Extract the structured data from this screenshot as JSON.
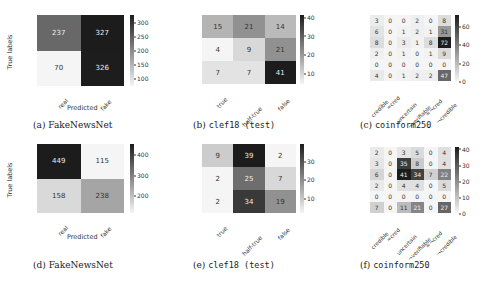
{
  "chart_data": [
    {
      "id": "a",
      "type": "heatmap",
      "caption_prefix": "(a)",
      "caption_name": "FakeNewsNet",
      "caption_mono": false,
      "ylabel": "True labels",
      "xlabel": "Predicted",
      "rows": [
        "real",
        "fake"
      ],
      "cols": [
        "real",
        "fake"
      ],
      "values": [
        [
          237,
          327
        ],
        [
          70,
          326
        ]
      ],
      "vmin": 70,
      "vmax": 327,
      "colorbar_ticks": [
        300,
        250,
        200,
        150,
        100
      ]
    },
    {
      "id": "b",
      "type": "heatmap",
      "caption_prefix": "(b)",
      "caption_name": "clef18 (test)",
      "caption_mono": true,
      "ylabel": "",
      "xlabel": "",
      "rows": [
        "true",
        "half-true",
        "false"
      ],
      "cols": [
        "true",
        "half-true",
        "false"
      ],
      "values": [
        [
          15,
          21,
          14
        ],
        [
          4,
          9,
          21
        ],
        [
          7,
          7,
          41
        ]
      ],
      "vmin": 4,
      "vmax": 41,
      "colorbar_ticks": [
        40,
        30,
        20,
        10
      ]
    },
    {
      "id": "c",
      "type": "heatmap",
      "caption_prefix": "(c)",
      "caption_name": "coinform250",
      "caption_mono": true,
      "ylabel": "",
      "xlabel": "",
      "rows": [
        "credible",
        "≈cred",
        "uncertain",
        "¬verifiable",
        "≈¬cred",
        "¬credible"
      ],
      "cols": [
        "credible",
        "≈cred",
        "uncertain",
        "¬verifiable",
        "≈¬cred",
        "¬credible"
      ],
      "values": [
        [
          3,
          0,
          0,
          2,
          0,
          8
        ],
        [
          6,
          0,
          1,
          2,
          1,
          31
        ],
        [
          8,
          0,
          3,
          1,
          8,
          72
        ],
        [
          2,
          0,
          1,
          0,
          1,
          9
        ],
        [
          0,
          0,
          0,
          0,
          0,
          0
        ],
        [
          4,
          0,
          1,
          2,
          2,
          47
        ]
      ],
      "vmin": 0,
      "vmax": 72,
      "colorbar_ticks": [
        60,
        40,
        20,
        0
      ]
    },
    {
      "id": "d",
      "type": "heatmap",
      "caption_prefix": "(d)",
      "caption_name": "FakeNewsNet",
      "caption_mono": false,
      "ylabel": "True labels",
      "xlabel": "Predicted",
      "rows": [
        "real",
        "fake"
      ],
      "cols": [
        "real",
        "fake"
      ],
      "values": [
        [
          449,
          115
        ],
        [
          158,
          238
        ]
      ],
      "vmin": 115,
      "vmax": 449,
      "colorbar_ticks": [
        400,
        300,
        200
      ]
    },
    {
      "id": "e",
      "type": "heatmap",
      "caption_prefix": "(e)",
      "caption_name": "clef18 (test)",
      "caption_mono": true,
      "ylabel": "",
      "xlabel": "",
      "rows": [
        "true",
        "half-true",
        "false"
      ],
      "cols": [
        "true",
        "half-true",
        "false"
      ],
      "values": [
        [
          9,
          39,
          2
        ],
        [
          2,
          25,
          7
        ],
        [
          2,
          34,
          19
        ]
      ],
      "vmin": 2,
      "vmax": 39,
      "colorbar_ticks": [
        30,
        20,
        10
      ]
    },
    {
      "id": "f",
      "type": "heatmap",
      "caption_prefix": "(f)",
      "caption_name": "coinform250",
      "caption_mono": true,
      "ylabel": "",
      "xlabel": "",
      "rows": [
        "credible",
        "≈cred",
        "uncertain",
        "¬verifiable",
        "≈¬cred",
        "¬credible"
      ],
      "cols": [
        "credible",
        "≈cred",
        "uncertain",
        "¬verifiable",
        "≈¬cred",
        "¬credible"
      ],
      "values": [
        [
          2,
          0,
          3,
          5,
          0,
          4
        ],
        [
          3,
          0,
          35,
          8,
          0,
          4
        ],
        [
          6,
          0,
          41,
          34,
          7,
          22
        ],
        [
          2,
          0,
          4,
          4,
          0,
          5
        ],
        [
          0,
          0,
          0,
          0,
          0,
          0
        ],
        [
          7,
          0,
          11,
          21,
          0,
          27
        ]
      ],
      "vmin": 0,
      "vmax": 41,
      "colorbar_ticks": [
        40,
        30,
        20,
        10,
        0
      ]
    }
  ],
  "layout": [
    {
      "left": 37,
      "top": 15,
      "w": 87,
      "h": 71,
      "cbx": 130,
      "cby": 15,
      "cbh": 71,
      "cap_x": 33,
      "cap_y": 120,
      "xlab_y": 88,
      "xtitle_x": 67,
      "xtitle_y": 104,
      "ytitle_x": 10,
      "ytitle_y": 52,
      "fs": 7,
      "xlab_fs": 6
    },
    {
      "left": 202,
      "top": 15,
      "w": 94,
      "h": 69,
      "cbx": 300,
      "cby": 15,
      "cbh": 69,
      "cap_x": 193,
      "cap_y": 120,
      "xlab_y": 86,
      "fs": 7,
      "xlab_fs": 6
    },
    {
      "left": 370,
      "top": 15,
      "w": 81,
      "h": 66,
      "cbx": 455,
      "cby": 15,
      "cbh": 66,
      "cap_x": 360,
      "cap_y": 120,
      "xlab_y": 82,
      "fs": 6,
      "xlab_fs": 5.5
    },
    {
      "left": 37,
      "top": 144,
      "w": 87,
      "h": 69,
      "cbx": 130,
      "cby": 144,
      "cbh": 69,
      "cap_x": 33,
      "cap_y": 260,
      "xlab_y": 215,
      "xtitle_x": 67,
      "xtitle_y": 233,
      "ytitle_x": 10,
      "ytitle_y": 180,
      "fs": 7,
      "xlab_fs": 6
    },
    {
      "left": 202,
      "top": 144,
      "w": 94,
      "h": 69,
      "cbx": 300,
      "cby": 144,
      "cbh": 69,
      "cap_x": 193,
      "cap_y": 260,
      "xlab_y": 215,
      "fs": 7,
      "xlab_fs": 6
    },
    {
      "left": 370,
      "top": 147,
      "w": 81,
      "h": 66,
      "cbx": 455,
      "cby": 147,
      "cbh": 66,
      "cap_x": 360,
      "cap_y": 260,
      "xlab_y": 214,
      "fs": 6,
      "xlab_fs": 5.5
    }
  ]
}
